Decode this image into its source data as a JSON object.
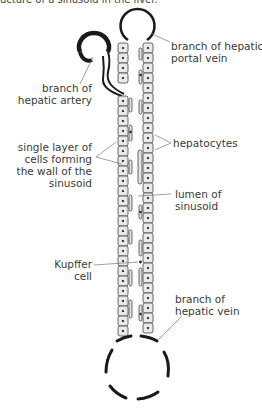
{
  "caption": "ucture of a sinusoid in the liver.",
  "labels": {
    "portal_vein": [
      "branch of hepatic",
      "portal vein"
    ],
    "hepatic_artery": [
      "branch of",
      "hepatic artery"
    ],
    "wall": [
      "single layer of",
      "cells forming",
      "the wall of the",
      "sinusoid"
    ],
    "hepatocytes": [
      "hepatocytes"
    ],
    "lumen": [
      "lumen of",
      "sinusoid"
    ],
    "kupffer": [
      "Kupffer",
      "cell"
    ],
    "hepatic_vein": [
      "branch of",
      "hepatic vein"
    ]
  },
  "colors": {
    "ink": "#1a1a1a",
    "cell_fill": "#e8e8e8",
    "leader": "#777777"
  }
}
